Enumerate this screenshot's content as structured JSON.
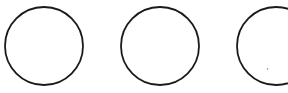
{
  "diagram": {
    "shape_type": "circle",
    "count": 3,
    "stroke_color": "#1a1a1a",
    "fill_color": "#ffffff",
    "background": "#ffffff",
    "circles": [
      {
        "id": "circle-1",
        "label": ""
      },
      {
        "id": "circle-2",
        "label": ""
      },
      {
        "id": "circle-3",
        "label": "",
        "partially_visible": true
      }
    ]
  }
}
